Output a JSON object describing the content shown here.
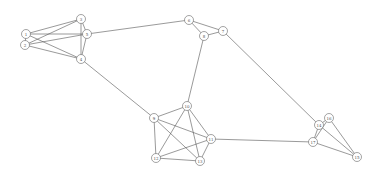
{
  "diagram": {
    "type": "undirected-graph",
    "nodes": [
      {
        "id": "1",
        "label": "1",
        "x": 26,
        "y": 34
      },
      {
        "id": "3",
        "label": "3",
        "x": 81,
        "y": 19
      },
      {
        "id": "5",
        "label": "5",
        "x": 87,
        "y": 34
      },
      {
        "id": "2",
        "label": "2",
        "x": 25,
        "y": 45
      },
      {
        "id": "4",
        "label": "4",
        "x": 81,
        "y": 59
      },
      {
        "id": "6",
        "label": "6",
        "x": 189,
        "y": 20
      },
      {
        "id": "8",
        "label": "8",
        "x": 204,
        "y": 36
      },
      {
        "id": "7",
        "label": "7",
        "x": 223,
        "y": 31
      },
      {
        "id": "9",
        "label": "9",
        "x": 154,
        "y": 118
      },
      {
        "id": "10",
        "label": "10",
        "x": 187,
        "y": 106
      },
      {
        "id": "11",
        "label": "11",
        "x": 211,
        "y": 139
      },
      {
        "id": "12",
        "label": "12",
        "x": 156,
        "y": 158
      },
      {
        "id": "13",
        "label": "13",
        "x": 200,
        "y": 161
      },
      {
        "id": "14",
        "label": "14",
        "x": 319,
        "y": 125
      },
      {
        "id": "16",
        "label": "16",
        "x": 329,
        "y": 118
      },
      {
        "id": "17",
        "label": "17",
        "x": 313,
        "y": 142
      },
      {
        "id": "15",
        "label": "15",
        "x": 357,
        "y": 157
      }
    ],
    "edges": [
      [
        "1",
        "3"
      ],
      [
        "1",
        "5"
      ],
      [
        "1",
        "4"
      ],
      [
        "2",
        "3"
      ],
      [
        "2",
        "5"
      ],
      [
        "2",
        "4"
      ],
      [
        "1",
        "2"
      ],
      [
        "3",
        "5"
      ],
      [
        "3",
        "4"
      ],
      [
        "5",
        "4"
      ],
      [
        "5",
        "6"
      ],
      [
        "6",
        "8"
      ],
      [
        "6",
        "7"
      ],
      [
        "8",
        "7"
      ],
      [
        "4",
        "9"
      ],
      [
        "8",
        "10"
      ],
      [
        "7",
        "14"
      ],
      [
        "9",
        "10"
      ],
      [
        "9",
        "11"
      ],
      [
        "9",
        "12"
      ],
      [
        "9",
        "13"
      ],
      [
        "10",
        "11"
      ],
      [
        "10",
        "12"
      ],
      [
        "10",
        "13"
      ],
      [
        "11",
        "12"
      ],
      [
        "11",
        "13"
      ],
      [
        "12",
        "13"
      ],
      [
        "11",
        "17"
      ],
      [
        "14",
        "16"
      ],
      [
        "14",
        "17"
      ],
      [
        "14",
        "15"
      ],
      [
        "16",
        "15"
      ],
      [
        "16",
        "17"
      ],
      [
        "17",
        "15"
      ]
    ]
  }
}
